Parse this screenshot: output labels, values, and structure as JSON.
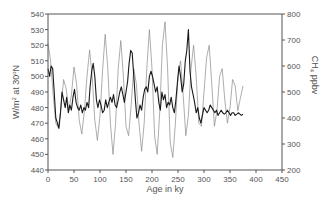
{
  "chart_data": {
    "type": "line",
    "title": "",
    "xlabel": "Age in ky",
    "ylabel_left": "W/m² at 30°N",
    "ylabel_right": "CH₄ ppbv",
    "xlim": [
      0,
      450
    ],
    "ylim_left": [
      440,
      540
    ],
    "ylim_right": [
      200,
      800
    ],
    "x_ticks": [
      0,
      50,
      100,
      150,
      200,
      250,
      300,
      350,
      400,
      450
    ],
    "y_ticks_left": [
      440,
      450,
      460,
      470,
      480,
      490,
      500,
      510,
      520,
      530,
      540
    ],
    "y_ticks_right": [
      200,
      300,
      400,
      500,
      600,
      700,
      800
    ],
    "grid": false,
    "legend": null,
    "series": [
      {
        "name": "Insolation at 30°N (W/m²)",
        "axis": "left",
        "style": "thin gray",
        "color": "#8a8a8a",
        "x": [
          0,
          5,
          10,
          15,
          20,
          25,
          30,
          35,
          40,
          45,
          50,
          55,
          60,
          65,
          70,
          75,
          80,
          85,
          90,
          95,
          100,
          105,
          110,
          115,
          120,
          125,
          130,
          135,
          140,
          145,
          150,
          155,
          160,
          165,
          170,
          175,
          180,
          185,
          190,
          195,
          200,
          205,
          210,
          215,
          220,
          225,
          230,
          235,
          240,
          245,
          250,
          255,
          260,
          265,
          270,
          275,
          280,
          285,
          290,
          295,
          300,
          305,
          310,
          315,
          320,
          325,
          330,
          335,
          340,
          345,
          350,
          355,
          360,
          365,
          370,
          375
        ],
        "y": [
          521,
          510,
          488,
          470,
          467,
          480,
          498,
          492,
          478,
          488,
          506,
          495,
          472,
          463,
          478,
          500,
          517,
          500,
          472,
          459,
          475,
          504,
          527,
          505,
          470,
          450,
          470,
          505,
          523,
          500,
          468,
          462,
          482,
          505,
          495,
          470,
          452,
          470,
          505,
          530,
          505,
          462,
          450,
          478,
          520,
          535,
          505,
          458,
          448,
          470,
          500,
          510,
          488,
          462,
          475,
          505,
          520,
          500,
          470,
          468,
          490,
          512,
          520,
          495,
          468,
          478,
          500,
          505,
          485,
          470,
          480,
          498,
          494,
          478,
          486,
          494
        ]
      },
      {
        "name": "CH₄ (ppbv)",
        "axis": "right",
        "style": "dark jagged",
        "color": "#1a1a1a",
        "x": [
          0,
          3,
          6,
          9,
          12,
          15,
          18,
          21,
          24,
          27,
          30,
          33,
          36,
          39,
          42,
          45,
          48,
          51,
          54,
          57,
          60,
          63,
          66,
          69,
          72,
          75,
          78,
          81,
          84,
          87,
          90,
          93,
          96,
          99,
          102,
          105,
          108,
          111,
          114,
          117,
          120,
          123,
          126,
          129,
          132,
          135,
          138,
          141,
          144,
          147,
          150,
          153,
          156,
          159,
          162,
          165,
          168,
          171,
          174,
          177,
          180,
          183,
          186,
          189,
          192,
          195,
          198,
          201,
          204,
          207,
          210,
          213,
          216,
          219,
          222,
          225,
          228,
          231,
          234,
          237,
          240,
          243,
          246,
          249,
          252,
          255,
          258,
          261,
          264,
          267,
          270,
          273,
          276,
          279,
          282,
          285,
          288,
          291,
          294,
          297,
          300,
          303,
          306,
          309,
          312,
          315,
          318,
          321,
          324,
          327,
          330,
          333,
          336,
          339,
          342,
          345,
          348,
          351,
          354,
          357,
          360,
          363,
          366,
          369,
          372,
          375
        ],
        "y": [
          590,
          560,
          600,
          590,
          500,
          400,
          380,
          360,
          420,
          500,
          470,
          440,
          480,
          420,
          450,
          430,
          480,
          510,
          460,
          440,
          430,
          450,
          420,
          440,
          430,
          460,
          440,
          520,
          580,
          610,
          560,
          470,
          440,
          470,
          450,
          420,
          430,
          470,
          440,
          460,
          480,
          460,
          490,
          450,
          440,
          470,
          500,
          520,
          490,
          460,
          500,
          540,
          610,
          660,
          650,
          560,
          470,
          400,
          420,
          450,
          430,
          480,
          510,
          520,
          500,
          560,
          580,
          560,
          530,
          500,
          520,
          460,
          430,
          500,
          470,
          490,
          440,
          460,
          450,
          480,
          440,
          420,
          470,
          540,
          600,
          560,
          500,
          530,
          620,
          660,
          740,
          580,
          520,
          490,
          460,
          420,
          440,
          400,
          380,
          410,
          440,
          430,
          420,
          430,
          450,
          440,
          430,
          420,
          430,
          410,
          420,
          430,
          420,
          415,
          420,
          430,
          420,
          410,
          420,
          420,
          410,
          415,
          420,
          415,
          410,
          415
        ]
      }
    ]
  }
}
